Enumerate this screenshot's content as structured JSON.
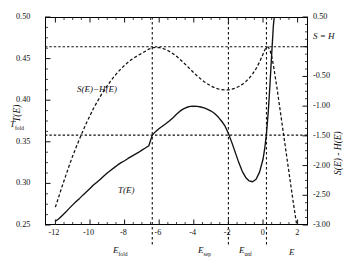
{
  "chart_data": {
    "type": "line",
    "title": "",
    "xlabel": "E",
    "ylabel_left": "T(E)",
    "ylabel_right": "S(E) - H(E)",
    "xlim": [
      -12.6,
      2.6
    ],
    "ylim_left": [
      0.25,
      0.5
    ],
    "ylim_right": [
      -3.0,
      0.5
    ],
    "grid": false,
    "legend": "inline-annotations",
    "x_ticks": [
      -12,
      -10,
      -8,
      -6,
      -4,
      -2,
      0,
      2
    ],
    "x_tick_labels": [
      "-12",
      "-10",
      "-8",
      "-6",
      "-4",
      "-2",
      "0",
      "2"
    ],
    "y_ticks_left": [
      0.25,
      0.3,
      0.35,
      0.4,
      0.45,
      0.5
    ],
    "y_tick_labels_left": [
      "0.25",
      "0.30",
      "0.35",
      "0.40",
      "0.45",
      "0.50"
    ],
    "y_ticks_right": [
      -3.0,
      -2.5,
      -2.0,
      -1.5,
      -1.0,
      -0.5,
      0.5
    ],
    "y_tick_labels_right": [
      "-3.00",
      "-2.50",
      "-2.00",
      "-1.50",
      "-1.00",
      "-0.50",
      "0.50"
    ],
    "annotations": {
      "t_fold_label": "T",
      "t_fold_sub": "fold",
      "t_fold_value": 0.358,
      "s_equals_h_label": "S = H",
      "s_equals_h_value": 0.0,
      "e_fold_label": "E",
      "e_fold_sub": "fold",
      "e_fold_value": -6.4,
      "e_sep_label": "E",
      "e_sep_sub": "sep",
      "e_sep_value": -2.0,
      "e_unf_label": "E",
      "e_unf_sub": "unf",
      "e_unf_value": 0.2,
      "curve_t_label": "T(E)",
      "curve_sh_label": "S(E)−H(E)"
    },
    "series": [
      {
        "name": "T(E)",
        "style": "solid",
        "axis": "left",
        "points": [
          [
            -12.0,
            0.2545
          ],
          [
            -11.8,
            0.2575
          ],
          [
            -11.6,
            0.2615
          ],
          [
            -11.4,
            0.2655
          ],
          [
            -11.2,
            0.27
          ],
          [
            -11.0,
            0.2742
          ],
          [
            -10.8,
            0.2782
          ],
          [
            -10.6,
            0.282
          ],
          [
            -10.4,
            0.2862
          ],
          [
            -10.2,
            0.29
          ],
          [
            -10.0,
            0.2938
          ],
          [
            -9.8,
            0.298
          ],
          [
            -9.6,
            0.3015
          ],
          [
            -9.4,
            0.305
          ],
          [
            -9.2,
            0.309
          ],
          [
            -9.0,
            0.3125
          ],
          [
            -8.8,
            0.3158
          ],
          [
            -8.6,
            0.319
          ],
          [
            -8.4,
            0.3222
          ],
          [
            -8.2,
            0.325
          ],
          [
            -8.0,
            0.3272
          ],
          [
            -7.8,
            0.33
          ],
          [
            -7.6,
            0.3325
          ],
          [
            -7.4,
            0.3348
          ],
          [
            -7.2,
            0.3372
          ],
          [
            -7.0,
            0.34
          ],
          [
            -6.8,
            0.3425
          ],
          [
            -6.6,
            0.3452
          ],
          [
            -6.4,
            0.358
          ],
          [
            -6.2,
            0.3625
          ],
          [
            -6.0,
            0.366
          ],
          [
            -5.8,
            0.369
          ],
          [
            -5.6,
            0.372
          ],
          [
            -5.4,
            0.3752
          ],
          [
            -5.2,
            0.379
          ],
          [
            -5.0,
            0.383
          ],
          [
            -4.8,
            0.3868
          ],
          [
            -4.6,
            0.3895
          ],
          [
            -4.4,
            0.3915
          ],
          [
            -4.2,
            0.3925
          ],
          [
            -4.0,
            0.3928
          ],
          [
            -3.8,
            0.3925
          ],
          [
            -3.6,
            0.3918
          ],
          [
            -3.4,
            0.3908
          ],
          [
            -3.2,
            0.389
          ],
          [
            -3.0,
            0.387
          ],
          [
            -2.8,
            0.384
          ],
          [
            -2.6,
            0.38
          ],
          [
            -2.4,
            0.375
          ],
          [
            -2.2,
            0.369
          ],
          [
            -2.0,
            0.36
          ],
          [
            -1.8,
            0.349
          ],
          [
            -1.6,
            0.337
          ],
          [
            -1.4,
            0.325
          ],
          [
            -1.2,
            0.3145
          ],
          [
            -1.0,
            0.3072
          ],
          [
            -0.8,
            0.303
          ],
          [
            -0.6,
            0.302
          ],
          [
            -0.4,
            0.305
          ],
          [
            -0.2,
            0.3135
          ],
          [
            0.0,
            0.329
          ],
          [
            0.1,
            0.342
          ],
          [
            0.2,
            0.36
          ],
          [
            0.3,
            0.385
          ],
          [
            0.4,
            0.418
          ],
          [
            0.5,
            0.455
          ],
          [
            0.6,
            0.49
          ],
          [
            0.65,
            0.5
          ]
        ]
      },
      {
        "name": "S(E)-H(E)",
        "style": "dashed",
        "axis": "right",
        "points": [
          [
            -12.0,
            -2.7
          ],
          [
            -11.8,
            -2.52
          ],
          [
            -11.6,
            -2.34
          ],
          [
            -11.4,
            -2.17
          ],
          [
            -11.2,
            -2.0
          ],
          [
            -11.0,
            -1.84
          ],
          [
            -10.8,
            -1.69
          ],
          [
            -10.6,
            -1.55
          ],
          [
            -10.4,
            -1.41
          ],
          [
            -10.2,
            -1.28
          ],
          [
            -10.0,
            -1.16
          ],
          [
            -9.8,
            -1.04
          ],
          [
            -9.6,
            -0.935
          ],
          [
            -9.4,
            -0.835
          ],
          [
            -9.2,
            -0.742
          ],
          [
            -9.0,
            -0.655
          ],
          [
            -8.8,
            -0.575
          ],
          [
            -8.6,
            -0.5
          ],
          [
            -8.4,
            -0.432
          ],
          [
            -8.2,
            -0.37
          ],
          [
            -8.0,
            -0.313
          ],
          [
            -7.8,
            -0.262
          ],
          [
            -7.6,
            -0.217
          ],
          [
            -7.4,
            -0.177
          ],
          [
            -7.2,
            -0.142
          ],
          [
            -7.0,
            -0.112
          ],
          [
            -6.8,
            -0.075
          ],
          [
            -6.6,
            -0.04
          ],
          [
            -6.4,
            -0.018
          ],
          [
            -6.2,
            -0.012
          ],
          [
            -6.0,
            -0.015
          ],
          [
            -5.8,
            -0.028
          ],
          [
            -5.6,
            -0.05
          ],
          [
            -5.4,
            -0.08
          ],
          [
            -5.2,
            -0.118
          ],
          [
            -5.0,
            -0.162
          ],
          [
            -4.8,
            -0.212
          ],
          [
            -4.6,
            -0.266
          ],
          [
            -4.4,
            -0.322
          ],
          [
            -4.2,
            -0.38
          ],
          [
            -4.0,
            -0.438
          ],
          [
            -3.8,
            -0.492
          ],
          [
            -3.6,
            -0.542
          ],
          [
            -3.4,
            -0.588
          ],
          [
            -3.2,
            -0.628
          ],
          [
            -3.0,
            -0.662
          ],
          [
            -2.8,
            -0.69
          ],
          [
            -2.6,
            -0.71
          ],
          [
            -2.4,
            -0.722
          ],
          [
            -2.2,
            -0.727
          ],
          [
            -2.0,
            -0.725
          ],
          [
            -1.8,
            -0.715
          ],
          [
            -1.6,
            -0.697
          ],
          [
            -1.4,
            -0.67
          ],
          [
            -1.2,
            -0.634
          ],
          [
            -1.0,
            -0.588
          ],
          [
            -0.8,
            -0.53
          ],
          [
            -0.6,
            -0.458
          ],
          [
            -0.4,
            -0.368
          ],
          [
            -0.2,
            -0.258
          ],
          [
            0.0,
            -0.125
          ],
          [
            0.1,
            -0.055
          ],
          [
            0.2,
            -0.012
          ],
          [
            0.3,
            -0.005
          ],
          [
            0.4,
            -0.055
          ],
          [
            0.5,
            -0.16
          ],
          [
            0.6,
            -0.31
          ],
          [
            0.8,
            -0.68
          ],
          [
            1.0,
            -1.09
          ],
          [
            1.2,
            -1.5
          ],
          [
            1.4,
            -1.91
          ],
          [
            1.6,
            -2.32
          ],
          [
            1.8,
            -2.72
          ],
          [
            1.95,
            -3.0
          ]
        ]
      }
    ]
  }
}
